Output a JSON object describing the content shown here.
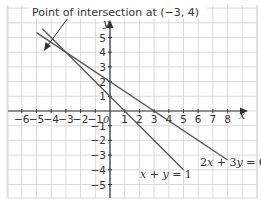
{
  "chart_data": {
    "type": "line",
    "title": "",
    "annotation": "Point of intersection at (−3, 4)",
    "intersection": {
      "x": -3,
      "y": 4
    },
    "xlabel": "x",
    "ylabel": "y",
    "origin_label": "0",
    "xlim": [
      -7,
      10
    ],
    "ylim": [
      -6,
      7
    ],
    "grid": true,
    "x_ticks": [
      "-6",
      "-5",
      "-4",
      "-3",
      "-2",
      "-1",
      "1",
      "2",
      "3",
      "4",
      "5",
      "6",
      "7",
      "8"
    ],
    "y_ticks": [
      "5",
      "4",
      "3",
      "2",
      "1",
      "-1",
      "-2",
      "-3",
      "-4",
      "-5"
    ],
    "series": [
      {
        "name": "x + y = 1",
        "x": [
          -4.6,
          5
        ],
        "y": [
          5.6,
          -4
        ],
        "label": "x + y = 1"
      },
      {
        "name": "2x + 3y = 6",
        "x": [
          -5,
          8
        ],
        "y": [
          5.33,
          -3.33
        ],
        "label": "2x + 3y = 6"
      }
    ]
  },
  "labels": {
    "annotation": "Point of intersection at (−3, 4)",
    "x_axis": "x",
    "y_axis": "y",
    "origin": "0",
    "line1": "x + y = 1",
    "line2": "2x + 3y = 6"
  }
}
